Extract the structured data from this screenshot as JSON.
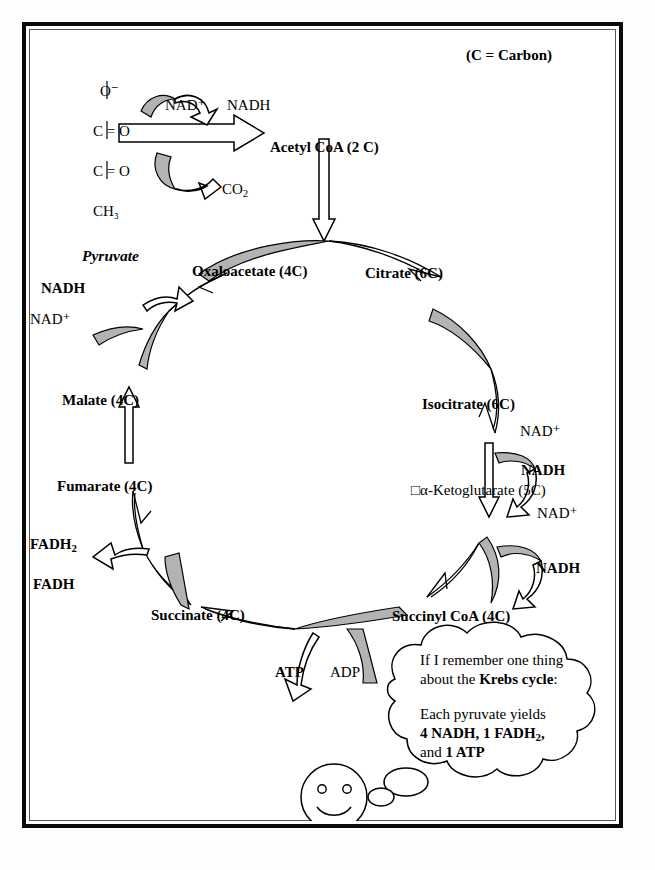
{
  "figure": {
    "legend_note": "(C = Carbon)",
    "colors": {
      "ink": "#000000",
      "gray_fill": "#b3b3b3",
      "frame": "#0a0a0a",
      "background": "#ffffff"
    }
  },
  "pyruvate": {
    "name": "Pyruvate",
    "structure_atoms": [
      "O⁻",
      "C = O",
      "C = O",
      "CH₃"
    ]
  },
  "pdh_reaction": {
    "cofactor_in": "NAD⁺",
    "cofactor_out": "NADH",
    "byproduct": "CO",
    "byproduct_sub": "2",
    "product": "Acetyl CoA (2 C)"
  },
  "cycle": {
    "intermediates": [
      {
        "key": "oxaloacetate",
        "label": "Oxaloacetate (4C)"
      },
      {
        "key": "citrate",
        "label": "Citrate (6C)"
      },
      {
        "key": "isocitrate",
        "label": "Isocitrate (6C)"
      },
      {
        "key": "ketoglutarate",
        "label": "□α-Ketoglutarate (5C)"
      },
      {
        "key": "succinyl_coa",
        "label": "Succinyl CoA (4C)"
      },
      {
        "key": "succinate",
        "label": "Succinate (4C)"
      },
      {
        "key": "fumarate",
        "label": "Fumarate (4C)"
      },
      {
        "key": "malate",
        "label": "Malate (4C)"
      }
    ],
    "cofactors": {
      "malate_nad_in": "NAD⁺",
      "malate_nadh_out": "NADH",
      "isocitrate_nad_in": "NAD⁺",
      "isocitrate_nadh_out": "NADH",
      "ketoglutarate_nad_in": "NAD⁺",
      "ketoglutarate_nadh_out": "NADH",
      "succinate_fad_in": "FADH",
      "succinate_fadh2_out_main": "FADH",
      "succinate_fadh2_out_sub": "2",
      "atp_out": "ATP",
      "adp_in": "ADP"
    }
  },
  "thought_bubble": {
    "line1": "If I remember one thing",
    "line2_plain": "about the ",
    "line2_bold": "Krebs cycle",
    "line2_tail": ":",
    "line3": "Each pyruvate yields",
    "line4_a": "4 NADH, 1 FADH",
    "line4_sub": "2",
    "line4_b": ",",
    "line5_plain": "and ",
    "line5_bold": "1 ATP"
  },
  "character": {
    "name": "smiley-face"
  }
}
